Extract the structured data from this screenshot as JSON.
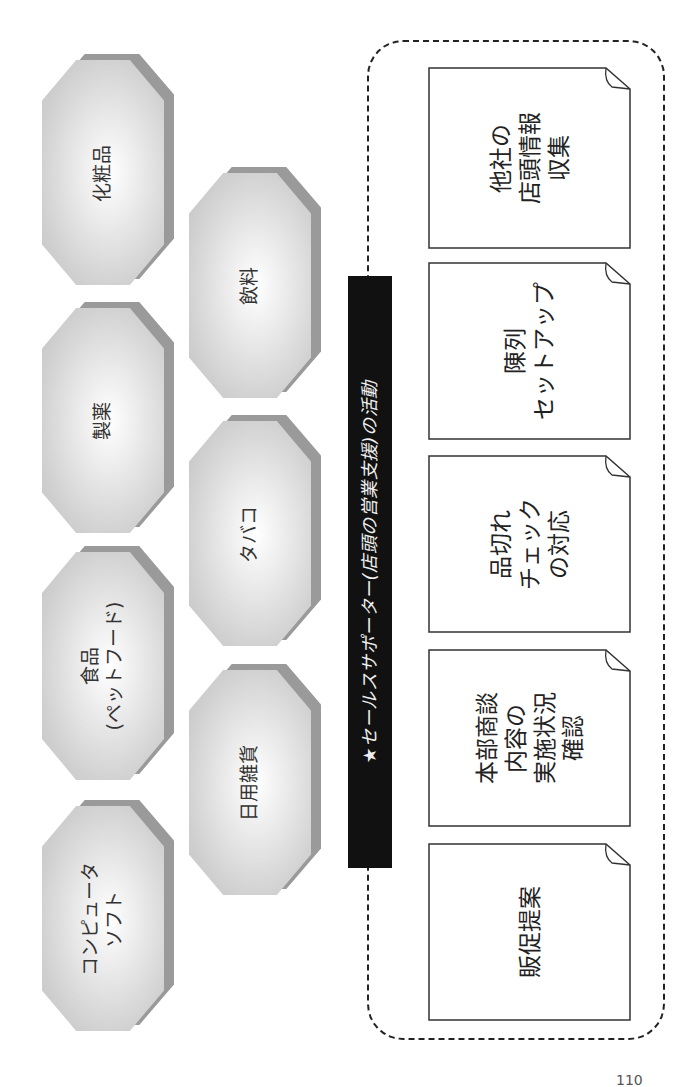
{
  "categories": [
    {
      "label": "化粧品"
    },
    {
      "label": "製薬"
    },
    {
      "label": "食品\n(ペットフード)"
    },
    {
      "label": "コンピュータ\nソフト"
    },
    {
      "label": "飲料"
    },
    {
      "label": "タバコ"
    },
    {
      "label": "日用雑貨"
    }
  ],
  "banner": {
    "icon": "★",
    "label": "セールスサポーター(店頭の営業支援)の活動"
  },
  "activities": [
    {
      "label": "他社の\n店頭情報\n収集"
    },
    {
      "label": "陳列\nセットアップ"
    },
    {
      "label": "品切れ\nチェック\nの対応"
    },
    {
      "label": "本部商談\n内容の\n実施状況\n確認"
    },
    {
      "label": "販促提案"
    }
  ],
  "page": {
    "number": "110"
  }
}
